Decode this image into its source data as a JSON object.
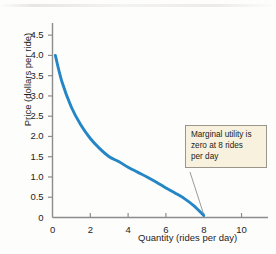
{
  "chart_data": {
    "type": "line",
    "title": "",
    "xlabel": "Quantity (rides per day)",
    "ylabel": "Price (dollars per ride)",
    "xlim": [
      0,
      11.4
    ],
    "ylim": [
      0,
      4.8
    ],
    "xticks": [
      "0",
      "2",
      "4",
      "6",
      "8",
      "10"
    ],
    "xtick_values": [
      0,
      2,
      4,
      6,
      8,
      10
    ],
    "yticks": [
      "0",
      "0.5",
      "1.0",
      "1.5",
      "2.0",
      "2.5",
      "3.0",
      "3.5",
      "4.0",
      "4.5"
    ],
    "ytick_values": [
      0,
      0.5,
      1.0,
      1.5,
      2.0,
      2.5,
      3.0,
      3.5,
      4.0,
      4.5
    ],
    "grid": false,
    "legend": null,
    "series": [
      {
        "name": "Demand / marginal utility curve",
        "color": "#2486c4",
        "x": [
          0.15,
          0.5,
          1.0,
          1.5,
          2.0,
          2.5,
          3.0,
          3.5,
          4.0,
          4.5,
          5.0,
          5.5,
          6.0,
          6.5,
          7.0,
          7.5,
          8.0
        ],
        "y": [
          4.0,
          3.35,
          2.72,
          2.28,
          1.95,
          1.7,
          1.5,
          1.38,
          1.24,
          1.12,
          1.0,
          0.87,
          0.73,
          0.6,
          0.46,
          0.28,
          0.05
        ]
      }
    ],
    "annotations": [
      {
        "name": "marginal-utility-callout",
        "text": "Marginal utility is zero at 8 rides per day",
        "lines": [
          "Marginal utility is",
          "zero at 8 rides",
          "per day"
        ],
        "points_to": {
          "x": 8,
          "y": 0
        },
        "box_color": "#f7f1dd",
        "border_color": "#9b968c",
        "leader_color": "#8e8e8e"
      }
    ],
    "axis_color": "#8c8c8c",
    "background": "#fdfdfc"
  }
}
